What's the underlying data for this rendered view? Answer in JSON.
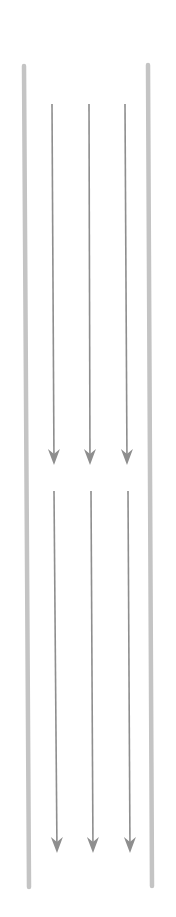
{
  "diagram": {
    "colors": {
      "rail": "#c4c4c4",
      "arrow": "#8e8e8e",
      "background": "#ffffff"
    },
    "rails": [
      {
        "name": "left-rail",
        "x1": 24,
        "y1": 66,
        "x2": 29,
        "y2": 887
      },
      {
        "name": "right-rail",
        "x1": 148,
        "y1": 65,
        "x2": 152,
        "y2": 886
      }
    ],
    "arrow_groups": [
      {
        "name": "upper-flow",
        "arrows": [
          {
            "x1": 52,
            "y1": 104,
            "x2": 54,
            "y2": 465
          },
          {
            "x1": 89,
            "y1": 104,
            "x2": 90,
            "y2": 465
          },
          {
            "x1": 125,
            "y1": 104,
            "x2": 127,
            "y2": 465
          }
        ]
      },
      {
        "name": "lower-flow",
        "arrows": [
          {
            "x1": 54,
            "y1": 491,
            "x2": 57,
            "y2": 853
          },
          {
            "x1": 91,
            "y1": 491,
            "x2": 93,
            "y2": 853
          },
          {
            "x1": 128,
            "y1": 491,
            "x2": 130,
            "y2": 853
          }
        ]
      }
    ]
  }
}
